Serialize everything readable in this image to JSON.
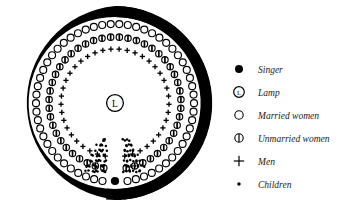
{
  "figure": {
    "title": "",
    "structure": {
      "outer_wall": "thick black annular ring with gap at bottom centre",
      "centre_marker": "lamp",
      "entrance": "gap at bottom centre of ring"
    },
    "lamp_label": "L",
    "colors": {
      "ink": "#000000",
      "paper": "#ffffff",
      "text": "#1a1a1a"
    }
  },
  "legend": {
    "items": [
      {
        "icon": "filled-circle-icon",
        "symbol": "singer",
        "label": "Singer"
      },
      {
        "icon": "circled-l-icon",
        "symbol": "lamp",
        "label": "Lamp"
      },
      {
        "icon": "open-circle-icon",
        "symbol": "married-women",
        "label": "Married women"
      },
      {
        "icon": "barred-circle-icon",
        "symbol": "unmarried-women",
        "label": "Unmarried women"
      },
      {
        "icon": "plus-icon",
        "symbol": "men",
        "label": "Men"
      },
      {
        "icon": "small-dot-icon",
        "symbol": "children",
        "label": "Children"
      }
    ]
  },
  "chart_data": {
    "type": "scatter",
    "xlabel": "",
    "ylabel": "",
    "geometry": {
      "centre": [
        115,
        103
      ],
      "wall_outer_radius": 97,
      "wall_inner_radius": 86,
      "ring_radii": {
        "married_women": 79,
        "unmarried_women": 66,
        "men": 54
      },
      "gap_degrees": [
        84,
        96
      ]
    },
    "series": [
      {
        "name": "Married women",
        "symbol": "open-circle",
        "count": 56,
        "ring_radius": 79
      },
      {
        "name": "Unmarried women",
        "symbol": "barred-circle",
        "count": 46,
        "ring_radius": 66
      },
      {
        "name": "Men",
        "symbol": "plus",
        "count": 40,
        "ring_radius": 54
      },
      {
        "name": "Children",
        "symbol": "small-dot",
        "count": 96,
        "ring_radius": 0
      },
      {
        "name": "Singer",
        "symbol": "filled-circle",
        "count": 1,
        "ring_radius": 0
      },
      {
        "name": "Lamp",
        "symbol": "circled-l",
        "count": 1,
        "ring_radius": 0
      }
    ]
  }
}
